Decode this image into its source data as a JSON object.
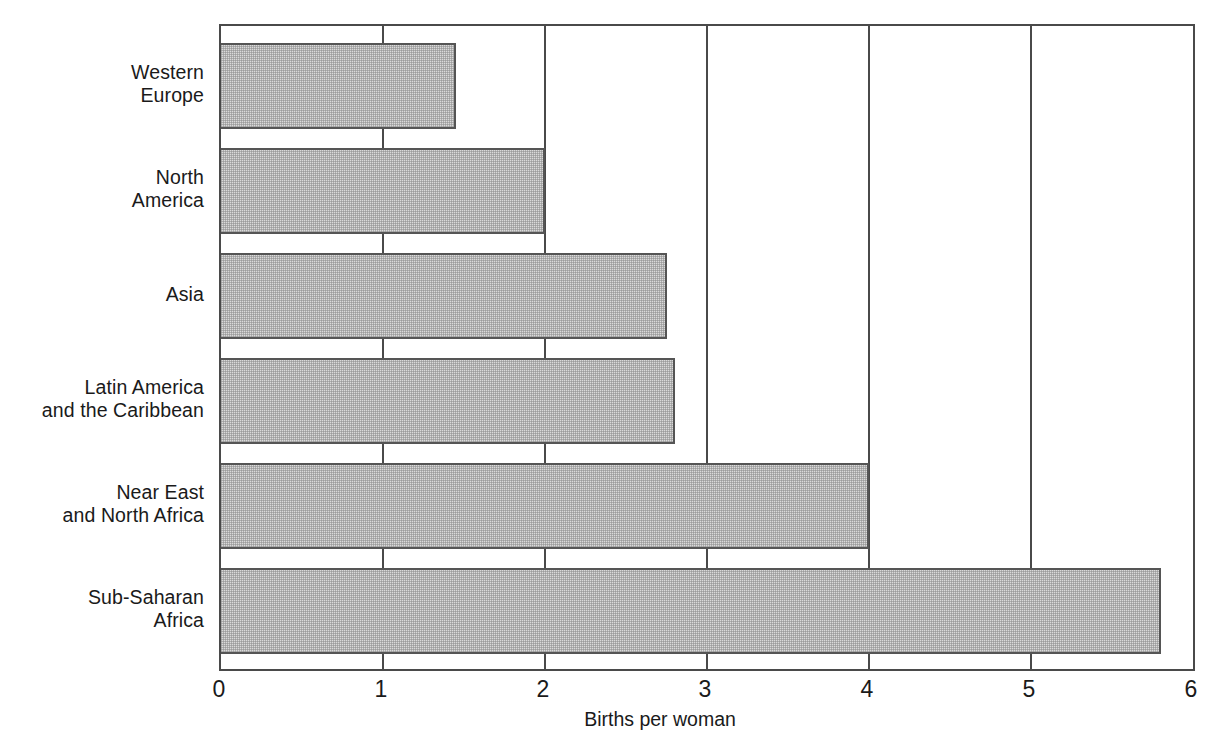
{
  "chart_data": {
    "type": "bar",
    "orientation": "horizontal",
    "title": "",
    "subtitle": "",
    "xlabel": "Births per woman",
    "ylabel": "",
    "xlim": [
      0,
      6
    ],
    "xticks": [
      "0",
      "1",
      "2",
      "3",
      "4",
      "5",
      "6"
    ],
    "grid": "vertical",
    "legend": "none",
    "categories": [
      "Western\nEurope",
      "North\nAmerica",
      "Asia",
      "Latin America\nand the Caribbean",
      "Near East\nand North Africa",
      "Sub-Saharan\nAfrica"
    ],
    "values": [
      1.45,
      2.0,
      2.75,
      2.8,
      4.0,
      5.8
    ],
    "bars": [
      {
        "label": "Western\nEurope",
        "value": 1.45
      },
      {
        "label": "North\nAmerica",
        "value": 2.0
      },
      {
        "label": "Asia",
        "value": 2.75
      },
      {
        "label": "Latin America\nand the Caribbean",
        "value": 2.8
      },
      {
        "label": "Near East\nand North Africa",
        "value": 4.0
      },
      {
        "label": "Sub-Saharan\nAfrica",
        "value": 5.8
      }
    ],
    "colors": {
      "bar_fill": "#dadada",
      "bar_stroke": "#555555",
      "axis": "#4a4a4a",
      "text": "#1a1a1a",
      "background": "#ffffff"
    }
  }
}
